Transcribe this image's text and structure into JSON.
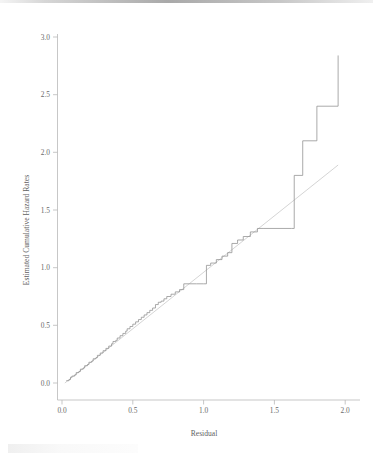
{
  "figure": {
    "background_color": "#ffffff",
    "step_line_color": "#8e8e8e",
    "reference_line_color": "#cfcfcf",
    "axis_color": "#b9b9b9"
  },
  "chart_data": {
    "type": "line",
    "title": "",
    "xlabel": "Residual",
    "ylabel": "Estimated Cumulative Hazard Rates",
    "xlim": [
      -0.06,
      2.1
    ],
    "ylim": [
      -0.1,
      3.1
    ],
    "xticks": [
      0.0,
      0.5,
      1.0,
      1.5,
      2.0
    ],
    "xtick_labels": [
      "0.0",
      "0.5",
      "1.0",
      "1.5",
      "2.0"
    ],
    "yticks": [
      0.0,
      0.5,
      1.0,
      1.5,
      2.0,
      2.5,
      3.0
    ],
    "ytick_labels": [
      "0.0",
      "0.5",
      "1.0",
      "1.5",
      "2.0",
      "2.5",
      "3.0"
    ],
    "grid": false,
    "legend": false,
    "legend_position": "none",
    "series": [
      {
        "name": "Estimated cumulative hazard (Nelson-Aalen step function)",
        "style": "step",
        "color": "#8e8e8e",
        "x": [
          0.03,
          0.05,
          0.06,
          0.07,
          0.09,
          0.1,
          0.12,
          0.13,
          0.15,
          0.16,
          0.18,
          0.19,
          0.21,
          0.22,
          0.24,
          0.25,
          0.27,
          0.29,
          0.31,
          0.33,
          0.35,
          0.36,
          0.38,
          0.39,
          0.41,
          0.43,
          0.45,
          0.46,
          0.48,
          0.5,
          0.52,
          0.54,
          0.56,
          0.58,
          0.6,
          0.62,
          0.64,
          0.66,
          0.68,
          0.7,
          0.72,
          0.74,
          0.77,
          0.8,
          0.83,
          0.86,
          0.9,
          0.95,
          1.0,
          1.02,
          1.05,
          1.09,
          1.13,
          1.17,
          1.2,
          1.24,
          1.28,
          1.33,
          1.38,
          1.42,
          1.62,
          1.64,
          1.7,
          1.8,
          1.95
        ],
        "y": [
          0.02,
          0.03,
          0.05,
          0.06,
          0.07,
          0.09,
          0.1,
          0.12,
          0.13,
          0.15,
          0.16,
          0.18,
          0.19,
          0.21,
          0.22,
          0.24,
          0.26,
          0.28,
          0.3,
          0.32,
          0.34,
          0.36,
          0.37,
          0.39,
          0.41,
          0.43,
          0.45,
          0.47,
          0.49,
          0.51,
          0.53,
          0.55,
          0.57,
          0.59,
          0.61,
          0.63,
          0.65,
          0.68,
          0.7,
          0.71,
          0.73,
          0.75,
          0.77,
          0.79,
          0.81,
          0.86,
          0.86,
          0.86,
          0.86,
          1.02,
          1.04,
          1.07,
          1.1,
          1.13,
          1.21,
          1.24,
          1.27,
          1.31,
          1.34,
          1.34,
          1.34,
          1.8,
          2.1,
          2.4,
          2.84
        ]
      },
      {
        "name": "45-degree reference line",
        "style": "line",
        "color": "#cfcfcf",
        "x": [
          0.02,
          1.95
        ],
        "y": [
          0.0,
          1.89
        ]
      }
    ],
    "annotations": []
  }
}
